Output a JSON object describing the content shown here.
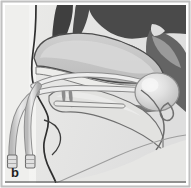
{
  "figure": {
    "panel_label": "b",
    "type": "anatomical-illustration",
    "colors": {
      "frame_border": "#b9b9b9",
      "outline_dark": "#3a3a3a",
      "background_paper": "#f2f2f0",
      "background_face": "#e3e3e1",
      "tissue_mid": "#c9c9c9",
      "tissue_dark": "#6e6e6e",
      "tissue_darkest": "#4a4a4a",
      "cavity_light": "#dedede",
      "balloon_fill": "#d2d2d2",
      "balloon_highlight": "#efefef",
      "tube_fill": "#d8d8d8",
      "tube_outline": "#8a8a8a",
      "label_color": "#231f20"
    },
    "regions": [
      {
        "name": "nasal-turbinates",
        "shade": "dark"
      },
      {
        "name": "nasal-septum-airway",
        "shade": "light"
      },
      {
        "name": "hard-palate",
        "shade": "mid"
      },
      {
        "name": "soft-palate",
        "shade": "mid"
      },
      {
        "name": "tongue",
        "shade": "light"
      },
      {
        "name": "nasopharynx",
        "shade": "dark"
      },
      {
        "name": "posterior-pharyngeal-wall",
        "shade": "dark"
      },
      {
        "name": "inflated-balloon",
        "shade": "light"
      },
      {
        "name": "catheter-tube-upper",
        "shade": "light"
      },
      {
        "name": "catheter-tube-lower",
        "shade": "light"
      },
      {
        "name": "catheter-connector-upper",
        "shade": "light"
      },
      {
        "name": "catheter-connector-lower",
        "shade": "light"
      },
      {
        "name": "anterior-packing-strip",
        "shade": "light"
      }
    ]
  }
}
